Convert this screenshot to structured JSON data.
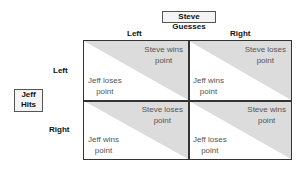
{
  "column_header": {
    "title": "Steve Guesses",
    "options": [
      "Left",
      "Right"
    ]
  },
  "row_header": {
    "title": "Jeff Hits",
    "options": [
      "Left",
      "Right"
    ]
  },
  "cells": [
    {
      "row": "Left",
      "col": "Left",
      "top_right": [
        "Steve wins",
        "point"
      ],
      "bottom_left": [
        "Jeff loses",
        "point"
      ]
    },
    {
      "row": "Left",
      "col": "Right",
      "top_right": [
        "Steve loses",
        "point"
      ],
      "bottom_left": [
        "Jeff wins",
        "point"
      ]
    },
    {
      "row": "Right",
      "col": "Left",
      "top_right": [
        "Steve loses",
        "point"
      ],
      "bottom_left": [
        "Jeff wins",
        "point"
      ]
    },
    {
      "row": "Right",
      "col": "Right",
      "top_right": [
        "Steve wins",
        "point"
      ],
      "bottom_left": [
        "Jeff loses",
        "point"
      ]
    }
  ],
  "colors": {
    "shade": "#dcdcdc",
    "border": "#333333",
    "text": "#555555"
  }
}
